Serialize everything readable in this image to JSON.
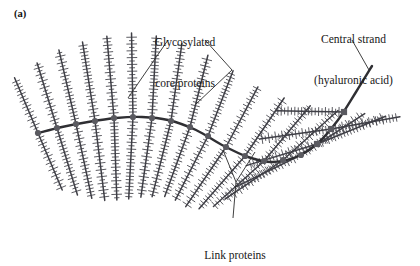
{
  "figure": {
    "panel_label": "(a)",
    "background_color": "#ffffff",
    "ink_color": "#3f3f46",
    "strand_color": "#2f2f33",
    "node_color": "#5a5a60",
    "leader_color": "#2a2a2a",
    "text_color": "#171717"
  },
  "labels": {
    "glycosylated": {
      "line1": "Glycosylated",
      "line2": "core proteins"
    },
    "central": {
      "line1": "Central strand",
      "line2": "(hyaluronic acid)"
    },
    "link": {
      "line1": "Link proteins"
    }
  },
  "diagram_data": {
    "type": "diagram",
    "subject": "proteoglycan aggregate",
    "central_strand": {
      "name": "hyaluronic acid",
      "path_points": [
        [
          38,
          133
        ],
        [
          62,
          127
        ],
        [
          88,
          122
        ],
        [
          116,
          118
        ],
        [
          142,
          117
        ],
        [
          168,
          120
        ],
        [
          196,
          130
        ],
        [
          222,
          145
        ],
        [
          248,
          157
        ],
        [
          272,
          162
        ],
        [
          296,
          157
        ],
        [
          318,
          143
        ],
        [
          338,
          120
        ],
        [
          356,
          92
        ],
        [
          372,
          66
        ]
      ],
      "node_radius": 3.1,
      "nodes": [
        {
          "x": 38,
          "y": 133,
          "shape": "circle"
        },
        {
          "x": 57,
          "y": 128,
          "shape": "circle"
        },
        {
          "x": 76,
          "y": 124,
          "shape": "circle"
        },
        {
          "x": 95,
          "y": 121,
          "shape": "circle"
        },
        {
          "x": 114,
          "y": 118,
          "shape": "circle"
        },
        {
          "x": 133,
          "y": 117,
          "shape": "circle"
        },
        {
          "x": 152,
          "y": 118,
          "shape": "circle"
        },
        {
          "x": 171,
          "y": 121,
          "shape": "circle"
        },
        {
          "x": 190,
          "y": 127,
          "shape": "circle"
        },
        {
          "x": 208,
          "y": 136,
          "shape": "circle"
        },
        {
          "x": 226,
          "y": 147,
          "shape": "circle"
        },
        {
          "x": 245,
          "y": 156,
          "shape": "circle"
        },
        {
          "x": 264,
          "y": 161,
          "shape": "circle"
        },
        {
          "x": 283,
          "y": 160,
          "shape": "circle"
        },
        {
          "x": 301,
          "y": 155,
          "shape": "circle"
        },
        {
          "x": 317,
          "y": 144,
          "shape": "square"
        },
        {
          "x": 331,
          "y": 129,
          "shape": "square"
        },
        {
          "x": 344,
          "y": 112,
          "shape": "square"
        }
      ]
    },
    "core_proteins": {
      "count": 26,
      "bristle_length_range": [
        52,
        86
      ],
      "barb_spacing": 3.4,
      "barb_length": 4.4,
      "items": [
        {
          "x": 38,
          "y": 133,
          "angle": 247,
          "length": 60
        },
        {
          "x": 57,
          "y": 128,
          "angle": 253,
          "length": 68
        },
        {
          "x": 76,
          "y": 124,
          "angle": 257,
          "length": 76
        },
        {
          "x": 95,
          "y": 121,
          "angle": 261,
          "length": 80
        },
        {
          "x": 114,
          "y": 118,
          "angle": 265,
          "length": 82
        },
        {
          "x": 133,
          "y": 117,
          "angle": 269,
          "length": 84
        },
        {
          "x": 152,
          "y": 118,
          "angle": 273,
          "length": 82
        },
        {
          "x": 171,
          "y": 121,
          "angle": 278,
          "length": 78
        },
        {
          "x": 190,
          "y": 127,
          "angle": 284,
          "length": 74
        },
        {
          "x": 208,
          "y": 136,
          "angle": 291,
          "length": 70
        },
        {
          "x": 226,
          "y": 147,
          "angle": 298,
          "length": 68
        },
        {
          "x": 245,
          "y": 156,
          "angle": 304,
          "length": 70
        },
        {
          "x": 264,
          "y": 161,
          "angle": 310,
          "length": 72
        },
        {
          "x": 283,
          "y": 160,
          "angle": 318,
          "length": 74
        },
        {
          "x": 301,
          "y": 155,
          "angle": 327,
          "length": 76
        },
        {
          "x": 317,
          "y": 144,
          "angle": 338,
          "length": 74
        },
        {
          "x": 331,
          "y": 129,
          "angle": 350,
          "length": 70
        },
        {
          "x": 38,
          "y": 133,
          "angle": 67,
          "length": 62
        },
        {
          "x": 57,
          "y": 128,
          "angle": 73,
          "length": 70
        },
        {
          "x": 76,
          "y": 124,
          "angle": 78,
          "length": 76
        },
        {
          "x": 95,
          "y": 121,
          "angle": 83,
          "length": 80
        },
        {
          "x": 114,
          "y": 118,
          "angle": 88,
          "length": 82
        },
        {
          "x": 133,
          "y": 117,
          "angle": 93,
          "length": 82
        },
        {
          "x": 152,
          "y": 118,
          "angle": 98,
          "length": 80
        },
        {
          "x": 171,
          "y": 121,
          "angle": 104,
          "length": 78
        },
        {
          "x": 190,
          "y": 127,
          "angle": 110,
          "length": 74
        },
        {
          "x": 208,
          "y": 136,
          "angle": 117,
          "length": 72
        },
        {
          "x": 226,
          "y": 147,
          "angle": 124,
          "length": 72
        },
        {
          "x": 245,
          "y": 156,
          "angle": 131,
          "length": 70
        },
        {
          "x": 264,
          "y": 161,
          "angle": 138,
          "length": 68
        },
        {
          "x": 283,
          "y": 160,
          "angle": 146,
          "length": 70
        },
        {
          "x": 301,
          "y": 155,
          "angle": 154,
          "length": 72
        },
        {
          "x": 317,
          "y": 144,
          "angle": 163,
          "length": 74
        },
        {
          "x": 331,
          "y": 129,
          "angle": 172,
          "length": 72
        },
        {
          "x": 344,
          "y": 112,
          "angle": 181,
          "length": 68
        }
      ]
    },
    "leader_lines": [
      {
        "name": "glycosylated-left",
        "points": [
          [
            168,
            40
          ],
          [
            128,
            98
          ]
        ]
      },
      {
        "name": "glycosylated-right",
        "points": [
          [
            205,
            40
          ],
          [
            232,
            70
          ],
          [
            196,
            104
          ]
        ]
      },
      {
        "name": "central-strand",
        "points": [
          [
            352,
            40
          ],
          [
            369,
            70
          ]
        ]
      },
      {
        "name": "link-left",
        "points": [
          [
            233,
            218
          ],
          [
            236,
            182
          ],
          [
            223,
            150
          ]
        ]
      },
      {
        "name": "link-right",
        "points": [
          [
            236,
            182
          ],
          [
            255,
            152
          ]
        ]
      }
    ]
  }
}
